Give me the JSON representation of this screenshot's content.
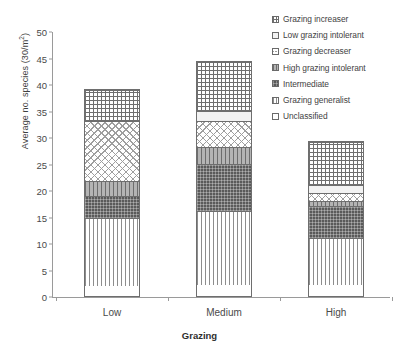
{
  "chart_data": {
    "type": "bar",
    "stacked": true,
    "title": "",
    "xlabel": "Grazing",
    "ylabel": "Average no. species (30/m²)",
    "ylabel_base": "Average no. species (30/m",
    "ylabel_sup": "2",
    "ylabel_tail": ")",
    "categories": [
      "Low",
      "Medium",
      "High"
    ],
    "ylim": [
      0,
      50
    ],
    "yticks": [
      0,
      5,
      10,
      15,
      20,
      25,
      30,
      35,
      40,
      45,
      50
    ],
    "grid": false,
    "legend_position": "top-right",
    "series": [
      {
        "name": "Unclassified",
        "pattern": "solid-white",
        "values": [
          1.8,
          2.0,
          2.0
        ]
      },
      {
        "name": "Grazing generalist",
        "pattern": "vertical-lines",
        "values": [
          13.0,
          14.0,
          9.0
        ]
      },
      {
        "name": "Intermediate",
        "pattern": "dark-dotted",
        "values": [
          4.0,
          9.0,
          6.0
        ]
      },
      {
        "name": "High grazing intolerant",
        "pattern": "gray-vertical-lines",
        "values": [
          3.0,
          3.2,
          1.0
        ]
      },
      {
        "name": "Grazing decreaser",
        "pattern": "checkerboard",
        "values": [
          11.2,
          4.8,
          1.5
        ]
      },
      {
        "name": "Low  grazing intolerant",
        "pattern": "light-fill",
        "values": [
          0.0,
          2.0,
          1.5
        ]
      },
      {
        "name": "Grazing increaser",
        "pattern": "fine-grid",
        "values": [
          5.8,
          9.1,
          8.0
        ]
      }
    ],
    "totals": [
      38.8,
      44.1,
      29.0
    ]
  },
  "legend": {
    "items": [
      {
        "label": "Grazing increaser"
      },
      {
        "label": "Low  grazing intolerant"
      },
      {
        "label": "Grazing decreaser"
      },
      {
        "label": "High grazing intolerant"
      },
      {
        "label": "Intermediate"
      },
      {
        "label": "Grazing generalist"
      },
      {
        "label": "Unclassified"
      }
    ]
  }
}
